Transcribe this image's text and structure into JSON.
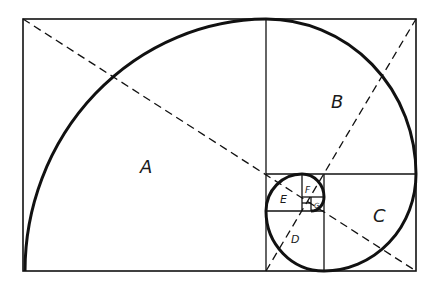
{
  "diagram": {
    "type": "golden-spiral",
    "labels": {
      "A": "A",
      "B": "B",
      "C": "C",
      "D": "D",
      "E": "E",
      "F": "F",
      "G": "G"
    },
    "colors": {
      "stroke": "#111111",
      "background": "#ffffff"
    }
  }
}
